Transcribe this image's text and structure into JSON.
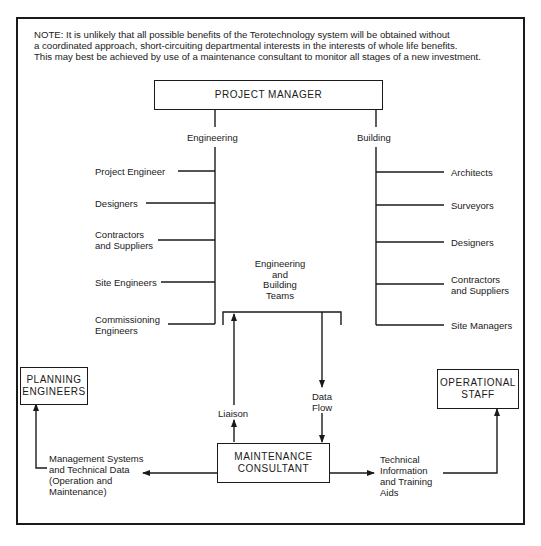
{
  "note": {
    "lines": [
      "NOTE:   It is unlikely that all possible benefits of the Terotechnology system will be obtained without",
      "a coordinated approach, short-circuiting departmental interests in the interests of whole life benefits.",
      "This may best be achieved by use of a maintenance consultant to monitor all stages of a new investment."
    ]
  },
  "project_manager": {
    "label": "PROJECT MANAGER"
  },
  "branches": {
    "engineering": {
      "label": "Engineering",
      "items": [
        "Project Engineer",
        "Designers",
        "Contractors\nand Suppliers",
        "Site Engineers",
        "Commissioning\nEngineers"
      ]
    },
    "building": {
      "label": "Building",
      "items": [
        "Architects",
        "Surveyors",
        "Designers",
        "Contractors\nand Suppliers",
        "Site Managers"
      ]
    }
  },
  "teams": {
    "label": "Engineering\nand\nBuilding\nTeams"
  },
  "flows": {
    "liaison": "Liaison",
    "data_flow": "Data\nFlow",
    "management_systems": "Management Systems\nand Technical Data\n(Operation and\nMaintenance)",
    "technical_information": "Technical\nInformation\nand Training\nAids"
  },
  "planning_engineers": {
    "label": "PLANNING\nENGINEERS"
  },
  "operational_staff": {
    "label": "OPERATIONAL\nSTAFF"
  },
  "maintenance_consultant": {
    "label": "MAINTENANCE\nCONSULTANT"
  },
  "colors": {
    "ink": "#1a1a1a",
    "paper": "#ffffff"
  }
}
